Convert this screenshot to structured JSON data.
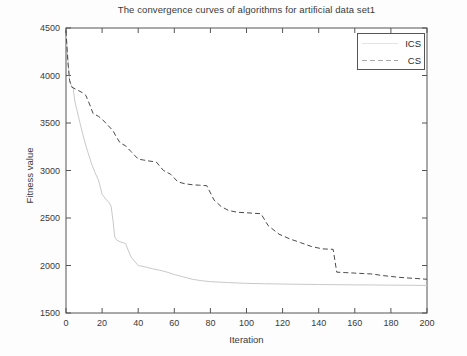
{
  "chart_data": {
    "type": "line",
    "title": "The convergence curves of algorithms for artificial data set1",
    "xlabel": "Iteration",
    "ylabel": "Fitness value",
    "xlim": [
      0,
      200
    ],
    "ylim": [
      1500,
      4500
    ],
    "xticks": [
      0,
      20,
      40,
      60,
      80,
      100,
      120,
      140,
      160,
      180,
      200
    ],
    "yticks": [
      1500,
      2000,
      2500,
      3000,
      3500,
      4000,
      4500
    ],
    "grid": false,
    "legend_position": "top-right",
    "series": [
      {
        "name": "ICS",
        "style": "solid",
        "color": "#c9c9c9",
        "x": [
          0,
          1,
          2,
          3,
          4,
          5,
          6,
          7,
          8,
          10,
          12,
          14,
          16,
          18,
          20,
          22,
          24,
          25,
          26,
          27,
          28,
          30,
          33,
          36,
          40,
          44,
          48,
          52,
          56,
          60,
          65,
          70,
          75,
          80,
          90,
          100,
          110,
          120,
          130,
          140,
          150,
          160,
          170,
          180,
          190,
          200
        ],
        "values": [
          4450,
          4200,
          3930,
          3900,
          3860,
          3720,
          3640,
          3560,
          3480,
          3330,
          3200,
          3080,
          2980,
          2900,
          2750,
          2700,
          2660,
          2620,
          2480,
          2300,
          2270,
          2250,
          2230,
          2090,
          2000,
          1985,
          1965,
          1950,
          1930,
          1905,
          1880,
          1855,
          1840,
          1830,
          1820,
          1812,
          1808,
          1805,
          1802,
          1800,
          1798,
          1796,
          1795,
          1793,
          1792,
          1790
        ]
      },
      {
        "name": "CS",
        "style": "dashed",
        "color": "#4a4a4a",
        "x": [
          0,
          1,
          2,
          3,
          5,
          7,
          9,
          11,
          13,
          15,
          18,
          20,
          23,
          26,
          28,
          30,
          33,
          36,
          38,
          40,
          43,
          46,
          50,
          54,
          58,
          62,
          66,
          70,
          74,
          78,
          82,
          86,
          90,
          95,
          100,
          104,
          108,
          112,
          118,
          124,
          130,
          136,
          142,
          148,
          150,
          155,
          160,
          165,
          170,
          175,
          180,
          185,
          190,
          195,
          200
        ],
        "values": [
          4470,
          4150,
          3950,
          3880,
          3860,
          3840,
          3820,
          3790,
          3700,
          3600,
          3570,
          3540,
          3480,
          3420,
          3350,
          3290,
          3260,
          3200,
          3160,
          3120,
          3110,
          3100,
          3090,
          3000,
          2960,
          2880,
          2860,
          2850,
          2845,
          2840,
          2690,
          2620,
          2580,
          2560,
          2555,
          2550,
          2545,
          2420,
          2330,
          2280,
          2240,
          2200,
          2175,
          2170,
          1930,
          1925,
          1920,
          1915,
          1910,
          1895,
          1885,
          1875,
          1868,
          1862,
          1855
        ]
      }
    ]
  },
  "legend": {
    "entries": [
      {
        "label": "ICS"
      },
      {
        "label": "CS"
      }
    ]
  },
  "colors": {
    "ics_line": "#c9c9c9",
    "cs_line": "#4a4a4a",
    "axis": "#555555",
    "text": "#3a3a3a",
    "background": "#fdfdfd"
  }
}
